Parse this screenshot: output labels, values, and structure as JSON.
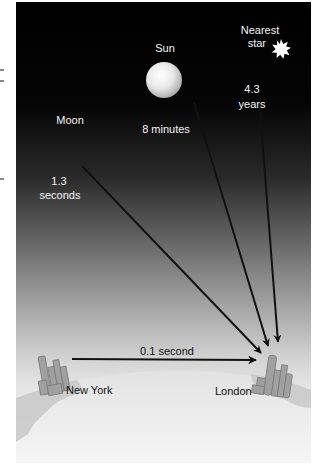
{
  "diagram": {
    "objects": [
      {
        "name": "Moon",
        "time": [
          "1.3",
          "seconds"
        ]
      },
      {
        "name": "Sun",
        "time": [
          "8 minutes"
        ]
      },
      {
        "name": "Nearest star",
        "name_lines": [
          "Nearest",
          "star"
        ],
        "time": [
          "4.3",
          "years"
        ]
      }
    ],
    "moon": {
      "name": "Moon",
      "time_value": "1.3",
      "time_unit": "seconds"
    },
    "sun": {
      "name": "Sun",
      "time": "8 minutes"
    },
    "star": {
      "name_line1": "Nearest",
      "name_line2": "star",
      "time_value": "4.3",
      "time_unit": "years"
    },
    "earth": {
      "origin_city": "New York",
      "destination_city": "London",
      "transit_time": "0.1 second"
    },
    "icons": {
      "moon": "crescent-moon-icon",
      "sun": "sun-sphere-icon",
      "star": "starburst-icon",
      "city_ny": "skyline-icon",
      "city_london": "skyline-icon"
    },
    "colors": {
      "sky_top": "#000000",
      "sky_bottom": "#e6e6e6",
      "earth_fill": "#ececec",
      "land": "#c4c4c4",
      "arrow": "#111111",
      "buildings": "#9a9a9a"
    }
  }
}
